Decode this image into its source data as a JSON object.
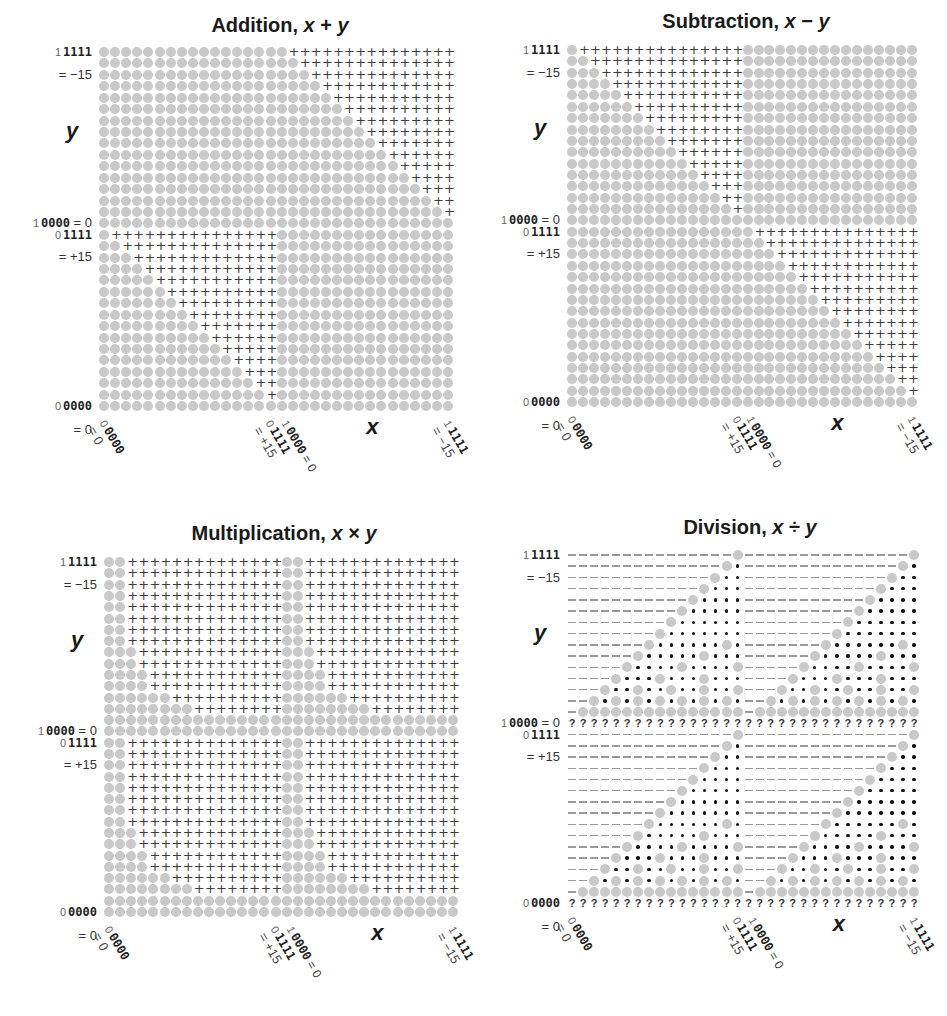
{
  "axis": {
    "y_var": "y",
    "x_var": "x",
    "y_labels": {
      "top_lead": "1",
      "top_bits": "1111",
      "top_eq": "= −15",
      "mid_neg": "1",
      "mid_neg_bits": "0000",
      "mid_neg_eq": " = 0",
      "mid_pos_lead": "0",
      "mid_pos_bits": "1111",
      "mid_pos_eq": "= +15",
      "bot_lead": "0",
      "bot_bits": "0000",
      "bot_eq": "= 0"
    },
    "x_labels": {
      "l0_lead": "0",
      "l0_bits": "0000",
      "l0_eq": "= 0",
      "l15_lead": "0",
      "l15_bits": "1111",
      "l15_eq": "= +15",
      "l16_lead": "1",
      "l16_bits": "0000",
      "l16_eq": " = 0",
      "l31_lead": "1",
      "l31_bits": "1111",
      "l31_eq": "= −15"
    }
  },
  "legend_symbols": {
    "o": "gray circle: representable / exact result",
    "+": "overflow",
    ".": "inexact quotient",
    "-": "zero quotient",
    "?": "division by zero (undefined)"
  },
  "chart_data": [
    {
      "type": "heatmap",
      "title": "Addition, x + y",
      "title_text": "Addition, ",
      "title_expr_a": "x",
      "title_op": " + ",
      "title_expr_b": "y",
      "xlabel": "x",
      "ylabel": "y",
      "x_ticks": [
        "0 0000 = 0",
        "0 1111 = +15",
        "1 0000 = 0",
        "1 1111 = −15"
      ],
      "y_ticks": [
        "1 1111 = −15",
        "1 0000 = 0",
        "0 1111 = +15",
        "0 0000 = 0"
      ],
      "grid_size": [
        32,
        32
      ],
      "rows_top_to_bottom": [
        "ooooooooooooooooo+++++++++++++++",
        "oooooooooooooooooo++++++++++++++",
        "ooooooooooooooooooo+++++++++++++",
        "oooooooooooooooooooo++++++++++++",
        "ooooooooooooooooooooo+++++++++++",
        "oooooooooooooooooooooo++++++++++",
        "ooooooooooooooooooooooo+++++++++",
        "oooooooooooooooooooooooo++++++++",
        "ooooooooooooooooooooooooo+++++++",
        "oooooooooooooooooooooooooo++++++",
        "ooooooooooooooooooooooooooo+++++",
        "oooooooooooooooooooooooooooo++++",
        "ooooooooooooooooooooooooooooo+++",
        "oooooooooooooooooooooooooooooo++",
        "ooooooooooooooooooooooooooooooo+",
        "oooooooooooooooooooooooooooooooo",
        "o+++++++++++++++oooooooooooooooo",
        "oo++++++++++++++oooooooooooooooo",
        "ooo+++++++++++++oooooooooooooooo",
        "oooo++++++++++++oooooooooooooooo",
        "ooooo+++++++++++oooooooooooooooo",
        "oooooo++++++++++oooooooooooooooo",
        "ooooooo+++++++++oooooooooooooooo",
        "oooooooo++++++++oooooooooooooooo",
        "ooooooooo+++++++oooooooooooooooo",
        "oooooooooo++++++oooooooooooooooo",
        "ooooooooooo+++++oooooooooooooooo",
        "oooooooooooo++++oooooooooooooooo",
        "ooooooooooooo+++oooooooooooooooo",
        "oooooooooooooo++oooooooooooooooo",
        "ooooooooooooooo+oooooooooooooooo",
        "oooooooooooooooooooooooooooooooo"
      ]
    },
    {
      "type": "heatmap",
      "title": "Subtraction, x − y",
      "title_text": "Subtraction, ",
      "title_expr_a": "x",
      "title_op": " − ",
      "title_expr_b": "y",
      "xlabel": "x",
      "ylabel": "y",
      "x_ticks": [
        "0 0000 = 0",
        "0 1111 = +15",
        "1 0000 = 0",
        "1 1111 = −15"
      ],
      "y_ticks": [
        "1 1111 = −15",
        "1 0000 = 0",
        "0 1111 = +15",
        "0 0000 = 0"
      ],
      "grid_size": [
        32,
        32
      ],
      "rows_top_to_bottom": [
        "o+++++++++++++++oooooooooooooooo",
        "oo++++++++++++++oooooooooooooooo",
        "ooo+++++++++++++oooooooooooooooo",
        "oooo++++++++++++oooooooooooooooo",
        "ooooo+++++++++++oooooooooooooooo",
        "oooooo++++++++++oooooooooooooooo",
        "ooooooo+++++++++oooooooooooooooo",
        "oooooooo++++++++oooooooooooooooo",
        "ooooooooo+++++++oooooooooooooooo",
        "oooooooooo++++++oooooooooooooooo",
        "ooooooooooo+++++oooooooooooooooo",
        "oooooooooooo++++oooooooooooooooo",
        "ooooooooooooo+++oooooooooooooooo",
        "oooooooooooooo++oooooooooooooooo",
        "ooooooooooooooo+oooooooooooooooo",
        "oooooooooooooooooooooooooooooooo",
        "ooooooooooooooooo+++++++++++++++",
        "oooooooooooooooooo++++++++++++++",
        "ooooooooooooooooooo+++++++++++++",
        "oooooooooooooooooooo++++++++++++",
        "ooooooooooooooooooooo+++++++++++",
        "oooooooooooooooooooooo++++++++++",
        "ooooooooooooooooooooooo+++++++++",
        "oooooooooooooooooooooooo++++++++",
        "ooooooooooooooooooooooooo+++++++",
        "oooooooooooooooooooooooooo++++++",
        "ooooooooooooooooooooooooooo+++++",
        "oooooooooooooooooooooooooooo++++",
        "ooooooooooooooooooooooooooooo+++",
        "oooooooooooooooooooooooooooooo++",
        "ooooooooooooooooooooooooooooooo+",
        "oooooooooooooooooooooooooooooooo"
      ]
    },
    {
      "type": "heatmap",
      "title": "Multiplication, x × y",
      "title_text": "Multiplication, ",
      "title_expr_a": "x",
      "title_op": " × ",
      "title_expr_b": "y",
      "xlabel": "x",
      "ylabel": "y",
      "x_ticks": [
        "0 0000 = 0",
        "0 1111 = +15",
        "1 0000 = 0",
        "1 1111 = −15"
      ],
      "y_ticks": [
        "1 1111 = −15",
        "1 0000 = 0",
        "0 1111 = +15",
        "0 0000 = 0"
      ],
      "grid_size": [
        32,
        32
      ],
      "rows_top_to_bottom": [
        "oo++++++++++++++oo++++++++++++++",
        "oo++++++++++++++oo++++++++++++++",
        "oo++++++++++++++oo++++++++++++++",
        "oo++++++++++++++oo++++++++++++++",
        "oo++++++++++++++oo++++++++++++++",
        "oo++++++++++++++oo++++++++++++++",
        "oo++++++++++++++oo++++++++++++++",
        "oo++++++++++++++oo++++++++++++++",
        "ooo+++++++++++++ooo+++++++++++++",
        "ooo+++++++++++++ooo+++++++++++++",
        "oooo++++++++++++oooo++++++++++++",
        "oooo++++++++++++oooo++++++++++++",
        "oooooo++++++++++oooooo++++++++++",
        "oooooooo++++++++oooooooo++++++++",
        "oooooooooooooooooooooooooooooooo",
        "oooooooooooooooooooooooooooooooo",
        "oo++++++++++++++oo++++++++++++++",
        "oo++++++++++++++oo++++++++++++++",
        "oo++++++++++++++oo++++++++++++++",
        "oo++++++++++++++oo++++++++++++++",
        "oo++++++++++++++oo++++++++++++++",
        "oo++++++++++++++oo++++++++++++++",
        "oo++++++++++++++oo++++++++++++++",
        "oo++++++++++++++oo++++++++++++++",
        "ooo+++++++++++++ooo+++++++++++++",
        "ooo+++++++++++++ooo+++++++++++++",
        "oooo++++++++++++oooo++++++++++++",
        "oooo++++++++++++oooo++++++++++++",
        "oooooo++++++++++oooooo++++++++++",
        "oooooooo++++++++oooooooo++++++++",
        "oooooooooooooooooooooooooooooooo",
        "oooooooooooooooooooooooooooooooo"
      ]
    },
    {
      "type": "heatmap",
      "title": "Division, x ÷ y",
      "title_text": "Division, ",
      "title_expr_a": "x",
      "title_op": " ÷ ",
      "title_expr_b": "y",
      "xlabel": "x",
      "ylabel": "y",
      "x_ticks": [
        "0 0000 = 0",
        "0 1111 = +15",
        "1 0000 = 0",
        "1 1111 = −15"
      ],
      "y_ticks": [
        "1 1111 = −15",
        "1 0000 = 0",
        "0 1111 = +15",
        "0 0000 = 0"
      ],
      "grid_size": [
        32,
        32
      ],
      "rows_top_to_bottom": [
        "---------------O---------------O",
        "--------------O.--------------O.",
        "-------------O..-------------O..",
        "------------O...------------O...",
        "-----------O....-----------O....",
        "----------O.....----------O.....",
        "---------O......---------O......",
        "--------O.......--------O.......",
        "-------O......O.-------O......O.",
        "------O.....O...------O.....O...",
        "-----O....O....O-----O....O....O",
        "----O...O...O...----O...O...O...",
        "---O..O..O..O..O---O..O..O..O..O",
        "--O.O.O.O.O.O.O.--O.O.O.O.O.O.O.",
        "-OOOOOOOOOOOOOOO-OOOOOOOOOOOOOOO",
        "????????????????????????????????",
        "---------------O---------------O",
        "--------------O.--------------O.",
        "-------------O..-------------O..",
        "------------O...------------O...",
        "-----------O....-----------O....",
        "----------O.....----------O.....",
        "---------O......---------O......",
        "--------O.......--------O.......",
        "-------O......O.-------O......O.",
        "------O.....O...------O.....O...",
        "-----O....O....O-----O....O....O",
        "----O...O...O...----O...O...O...",
        "---O..O..O..O..O---O..O..O..O..O",
        "--O.O.O.O.O.O.O.--O.O.O.O.O.O.O.",
        "-OOOOOOOOOOOOOOO-OOOOOOOOOOOOOOO",
        "????????????????????????????????"
      ]
    }
  ]
}
